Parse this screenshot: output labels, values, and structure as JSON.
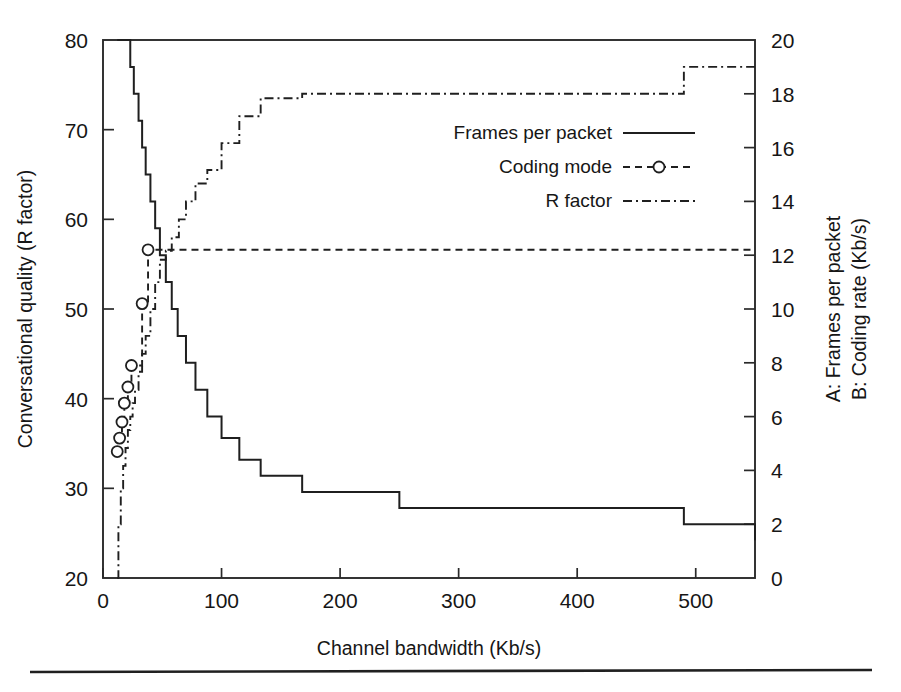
{
  "chart_data": {
    "type": "line",
    "title": "",
    "xlabel": "Channel bandwidth (Kb/s)",
    "ylabel": "Conversational quality (R factor)",
    "y2label_a": "A: Frames per packet",
    "y2label_b": "B: Coding rate (Kb/s)",
    "xlim": [
      0,
      550
    ],
    "ylim": [
      20,
      80
    ],
    "y2lim": [
      0,
      20
    ],
    "grid": false,
    "legend_position": "center-right",
    "xticks": [
      0,
      100,
      200,
      300,
      400,
      500
    ],
    "xtick_labels": [
      "0",
      "100",
      "200",
      "300",
      "400",
      "500"
    ],
    "yticks": [
      20,
      30,
      40,
      50,
      60,
      70,
      80
    ],
    "ytick_labels": [
      "20",
      "30",
      "40",
      "50",
      "60",
      "70",
      "80"
    ],
    "y2ticks": [
      0,
      2,
      4,
      6,
      8,
      10,
      12,
      14,
      16,
      18,
      20
    ],
    "y2tick_labels": [
      "0",
      "2",
      "4",
      "6",
      "8",
      "10",
      "12",
      "14",
      "16",
      "18",
      "20"
    ],
    "series": [
      {
        "name": "Frames per packet",
        "axis": "right",
        "style": "solid",
        "marker": "none",
        "step": "post",
        "x": [
          12,
          20,
          23,
          26,
          30,
          33,
          36,
          40,
          44,
          48,
          53,
          58,
          63,
          70,
          78,
          88,
          100,
          115,
          133,
          168,
          250,
          490,
          550
        ],
        "y": [
          20,
          20,
          19,
          18,
          17,
          16,
          15,
          14,
          13,
          12,
          11,
          10,
          9,
          8,
          7,
          6,
          5.2,
          4.4,
          3.8,
          3.2,
          2.6,
          2.0,
          1.4
        ]
      },
      {
        "name": "Coding mode",
        "axis": "right",
        "style": "dashed",
        "marker": "circle",
        "step": "post",
        "x": [
          12,
          14,
          16,
          18,
          21,
          24,
          33,
          38,
          550
        ],
        "y": [
          4.7,
          5.2,
          5.8,
          6.5,
          7.1,
          7.9,
          10.2,
          12.2,
          12.2
        ],
        "marker_x": [
          12,
          14,
          16,
          18,
          21,
          24,
          33,
          38
        ],
        "marker_y": [
          4.7,
          5.2,
          5.8,
          6.5,
          7.1,
          7.9,
          10.2,
          12.2
        ]
      },
      {
        "name": "R factor",
        "axis": "left",
        "style": "dashdot",
        "marker": "none",
        "step": "post",
        "x": [
          12,
          13,
          15,
          17,
          19,
          21,
          23,
          25,
          27,
          30,
          33,
          36,
          40,
          44,
          48,
          53,
          58,
          64,
          70,
          78,
          88,
          100,
          115,
          133,
          168,
          250,
          490,
          550
        ],
        "y": [
          20,
          26,
          30,
          32.5,
          34.5,
          36.5,
          38,
          39.5,
          41,
          43,
          45,
          47,
          50,
          53,
          55.5,
          56.5,
          58,
          60,
          62,
          64,
          65.5,
          68.5,
          71.5,
          73.5,
          74,
          74,
          77,
          77
        ]
      }
    ],
    "legend": [
      {
        "label": "Frames per packet",
        "style": "solid",
        "marker": "none"
      },
      {
        "label": "Coding mode",
        "style": "dashed",
        "marker": "circle"
      },
      {
        "label": "R factor",
        "style": "dashdot",
        "marker": "none"
      }
    ]
  }
}
